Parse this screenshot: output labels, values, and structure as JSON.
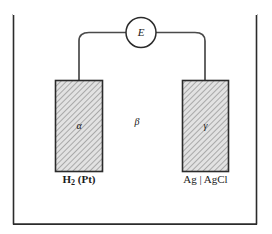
{
  "figure": {
    "frame": {
      "stroke_color": "#2b2b2b",
      "fill_color": "#ffffff"
    },
    "meter": {
      "label": "E",
      "shape": "circle",
      "stroke_color": "#2b2b2b"
    },
    "wire": {
      "stroke_color": "#4a4a4a"
    },
    "electrodes": [
      {
        "id": "left",
        "phase_symbol": "α",
        "label": "H",
        "label_subscript": "2",
        "label_suffix": " (Pt)",
        "fill_color": "#d9d9d9",
        "stroke_color": "#2b2b2b",
        "hatch": "diagonal"
      },
      {
        "id": "right",
        "phase_symbol": "γ",
        "label": "Ag | AgCl",
        "fill_color": "#d9d9d9",
        "stroke_color": "#2b2b2b",
        "hatch": "diagonal"
      }
    ],
    "electrolyte": {
      "phase_symbol": "β"
    }
  }
}
